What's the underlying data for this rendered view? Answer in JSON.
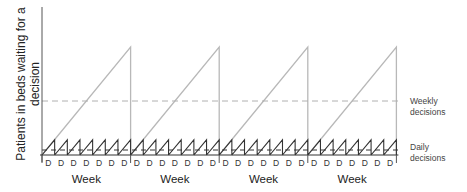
{
  "chart_data": {
    "type": "line",
    "title": "",
    "ylabel": "Patients in beds waiting for a decision",
    "xlabel": "",
    "weeks": [
      "Week",
      "Week",
      "Week",
      "Week"
    ],
    "day_labels": [
      "D",
      "D",
      "D",
      "D",
      "D",
      "D",
      "D"
    ],
    "series": [
      {
        "name": "Weekly decisions",
        "shape": "sawtooth",
        "period": "week",
        "peak_relative": 1.0,
        "color": "#b8b8b8"
      },
      {
        "name": "Daily decisions",
        "shape": "sawtooth",
        "period": "day",
        "peak_relative": 0.14,
        "color": "#333333"
      }
    ],
    "reference_lines": [
      {
        "label": "Weekly decisions",
        "level_relative": 0.5,
        "style": "dashed",
        "color": "#b0b0b0"
      },
      {
        "label": "Daily decisions",
        "level_relative": 0.05,
        "style": "dashed",
        "color": "#333333"
      }
    ],
    "grid": false
  },
  "labels": {
    "ylabel": "Patients in beds waiting for a decision",
    "weekly_line1": "Weekly",
    "weekly_line2": "decisions",
    "daily_line1": "Daily",
    "daily_line2": "decisions",
    "week": "Week",
    "day": "D"
  }
}
